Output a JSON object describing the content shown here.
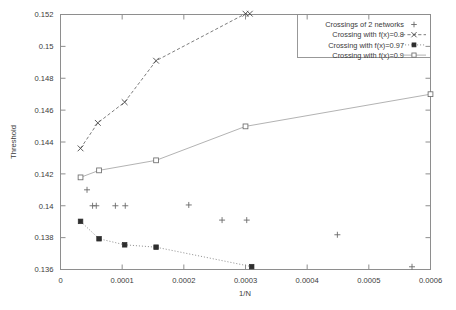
{
  "chart_data": {
    "type": "scatter",
    "title": "",
    "xlabel": "1/N",
    "ylabel": "Threshold",
    "xlim": [
      0,
      0.0006
    ],
    "ylim": [
      0.136,
      0.152
    ],
    "grid": false,
    "legend_position": "top-right",
    "xticks": [
      "0",
      "0.0001",
      "0.0002",
      "0.0003",
      "0.0004",
      "0.0005",
      "0.0006"
    ],
    "xtick_values": [
      0,
      0.0001,
      0.0002,
      0.0003,
      0.0004,
      0.0005,
      0.0006
    ],
    "yticks": [
      "0.136",
      "0.138",
      "0.14",
      "0.142",
      "0.144",
      "0.146",
      "0.148",
      "0.15",
      "0.152"
    ],
    "ytick_values": [
      0.136,
      0.138,
      0.14,
      0.142,
      0.144,
      0.146,
      0.148,
      0.15,
      0.152
    ],
    "series": [
      {
        "name": "Crossings of 2 networks",
        "marker": "plus",
        "line": "none",
        "color": "#6a6a6a",
        "x": [
          4.3e-05,
          5.2e-05,
          5.8e-05,
          8.9e-05,
          0.000105,
          0.000208,
          0.000262,
          0.000302,
          0.000449,
          0.00057
        ],
        "y": [
          0.141,
          0.14,
          0.14,
          0.14,
          0.14,
          0.14005,
          0.1391,
          0.1391,
          0.13818,
          0.13617
        ]
      },
      {
        "name": "Crossing with f(x)=0.8",
        "marker": "cross",
        "line": "dashed",
        "color": "#4a4a4a",
        "x": [
          3.25e-05,
          6.05e-05,
          0.000104,
          0.000155,
          0.0003,
          0.000307
        ],
        "y": [
          0.1436,
          0.1452,
          0.1465,
          0.1491,
          0.15205,
          0.15205
        ]
      },
      {
        "name": "Crossing with f(x)=0.97",
        "marker": "filled-square",
        "line": "dotted",
        "color": "#2e2e2e",
        "x": [
          3.25e-05,
          6.25e-05,
          0.000104,
          0.000155,
          0.00031
        ],
        "y": [
          0.13902,
          0.13793,
          0.13755,
          0.1374,
          0.13618
        ]
      },
      {
        "name": "Crossing with f(x)=0.9",
        "marker": "open-square",
        "line": "solid",
        "color": "#b3b3b3",
        "x": [
          3.25e-05,
          6.25e-05,
          0.000155,
          0.0003,
          0.0006
        ],
        "y": [
          0.14178,
          0.14222,
          0.14285,
          0.14498,
          0.147
        ]
      }
    ]
  },
  "legend": {
    "entries": [
      {
        "label": "Crossings of 2 networks"
      },
      {
        "label": "Crossing with f(x)=0.8"
      },
      {
        "label": "Crossing with f(x)=0.97"
      },
      {
        "label": "Crossing with f(x)=0.9"
      }
    ]
  }
}
